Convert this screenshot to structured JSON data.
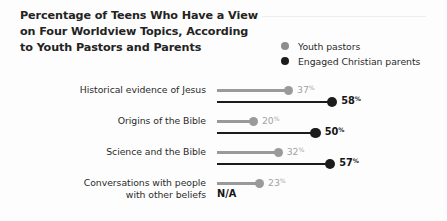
{
  "header": {
    "title_lines": [
      "Percentage of Teens Who Have a View",
      "on Four Worldview Topics, According",
      "to Youth Pastors and Parents"
    ]
  },
  "legend": {
    "items": [
      {
        "label": "Youth pastors",
        "color": "#8d8d8d",
        "key": "pastors"
      },
      {
        "label": "Engaged Christian parents",
        "color": "#1c1c1c",
        "key": "parents"
      }
    ]
  },
  "chart_data": {
    "type": "bar",
    "title": "Percentage of Teens Who Have a View on Four Worldview Topics, According to Youth Pastors and Parents",
    "xlabel": "",
    "ylabel": "",
    "xlim": [
      0,
      100
    ],
    "grid": false,
    "legend_position": "top-right",
    "value_suffix": "%",
    "categories": [
      "Historical evidence of Jesus",
      "Origins of the Bible",
      "Science and the Bible",
      "Conversations with people with other beliefs"
    ],
    "series": [
      {
        "name": "Youth pastors",
        "color": "#9a9a9a",
        "values": [
          37,
          20,
          32,
          23
        ],
        "labels": [
          "37",
          "20",
          "32",
          "23"
        ]
      },
      {
        "name": "Engaged Christian parents",
        "color": "#1c1c1c",
        "values": [
          58,
          50,
          57,
          null
        ],
        "labels": [
          "58",
          "50",
          "57",
          "N/A"
        ]
      }
    ]
  },
  "rows": [
    {
      "label_lines": [
        "Historical evidence of Jesus"
      ],
      "pastors": {
        "value": 37,
        "text": "37",
        "suffix": "%"
      },
      "parents": {
        "value": 58,
        "text": "58",
        "suffix": "%",
        "na": false
      }
    },
    {
      "label_lines": [
        "Origins of the Bible"
      ],
      "pastors": {
        "value": 20,
        "text": "20",
        "suffix": "%"
      },
      "parents": {
        "value": 50,
        "text": "50",
        "suffix": "%",
        "na": false
      }
    },
    {
      "label_lines": [
        "Science and the Bible"
      ],
      "pastors": {
        "value": 32,
        "text": "32",
        "suffix": "%"
      },
      "parents": {
        "value": 57,
        "text": "57",
        "suffix": "%",
        "na": false
      }
    },
    {
      "label_lines": [
        "Conversations with people",
        "with other beliefs"
      ],
      "pastors": {
        "value": 23,
        "text": "23",
        "suffix": "%"
      },
      "parents": {
        "value": null,
        "text": "N/A",
        "suffix": "",
        "na": true
      }
    }
  ]
}
